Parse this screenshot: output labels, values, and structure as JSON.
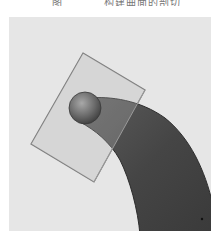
{
  "caption": {
    "figure_number": "图",
    "text": "构建曲面的剖切"
  },
  "figure": {
    "background_color": "#e6e6e6",
    "viewport": {
      "x": 9,
      "y": 17,
      "width": 202,
      "height": 214
    },
    "section_plane": {
      "fill": "#d4d4d4",
      "stroke": "#7a7a7a",
      "corners": [
        [
          83,
          53
        ],
        [
          145,
          90
        ],
        [
          94,
          182
        ],
        [
          31,
          144
        ]
      ]
    },
    "body": {
      "fill_dark": "#3e3e3e",
      "fill_mid": "#5a5a5a"
    },
    "sphere": {
      "cx": 85,
      "cy": 108,
      "r": 16,
      "highlight": "#9a9a9a",
      "shadow": "#4a4a4a"
    }
  }
}
